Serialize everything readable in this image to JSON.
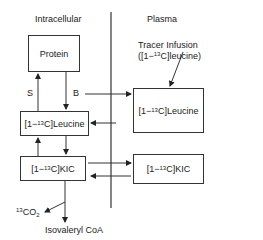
{
  "regions": {
    "intracellular": "Intracellular",
    "plasma": "Plasma"
  },
  "nodes": {
    "protein": "Protein",
    "ic_leucine": {
      "prefix": "[1−",
      "iso": "13",
      "suffix": "C]Leucine"
    },
    "ic_kic": {
      "prefix": "[1−",
      "iso": "13",
      "suffix": "C]KIC"
    },
    "pl_leucine": {
      "prefix": "[1−",
      "iso": "13",
      "suffix": "C]Leucine"
    },
    "pl_kic": {
      "prefix": "[1−",
      "iso": "13",
      "suffix": "C]KIC"
    }
  },
  "edges": {
    "synthesis_label": "S",
    "breakdown_label": "B"
  },
  "tracer": {
    "line1": "Tracer Infusion",
    "line2_prefix": "([1−",
    "line2_iso": "13",
    "line2_suffix": "C]leucine)"
  },
  "products": {
    "co2_iso": "13",
    "co2_main": "CO",
    "co2_sub": "2",
    "isovaleryl": "Isovaleryl CoA"
  }
}
